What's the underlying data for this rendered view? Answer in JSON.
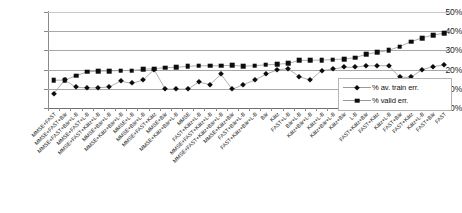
{
  "chart_data": {
    "type": "line",
    "title": "",
    "xlabel": "",
    "ylabel": "",
    "ylim": [
      0,
      50
    ],
    "yticks": [
      "0%",
      "10%",
      "20%",
      "30%",
      "40%",
      "50%"
    ],
    "grid": true,
    "legend_position": "inside-bottom-right",
    "categories": [
      "MMSE+FAST",
      "MMSE+FAST+Bär",
      "MMSE+FAST+Bär+L-B",
      "MMSE+FAST+L-B",
      "MMSE+FAST+Kätz+L-B",
      "MMSE+Bär+L-B",
      "MMSE+Kätz+Bär+L-B",
      "MMSE+L-B",
      "MMSE+Bär+L-B",
      "MMSE+FAST+Kätz",
      "MMSE+Bär",
      "MMSE+Kätz+Bär+L-B",
      "MMSE",
      "FAST+Kätz+L-B",
      "MMSE+FAST+Kätz+L-B",
      "MMSE+FAST+Kätz+Bär+L-B",
      "MMSE+Kätz+Bär",
      "FAST+Bär+L-B",
      "FAST+Kätz+Bär+L-B",
      "Bär",
      "Kätz",
      "FAST+L-B",
      "Bär+L-B",
      "Kätz+Bär+L-B",
      "Kätz+L-B",
      "Kätz+Bär+L-B",
      "Kätz+Bär",
      "L-B",
      "FAST+Kätz+Bär",
      "FAST+Kätz",
      "Kätz+L-B",
      "FAST+Bär",
      "FAST+Kätz",
      "Kätz+L-B",
      "FAST+Bär",
      "FAST"
    ],
    "series": [
      {
        "name": "% av. train err.",
        "marker": "diamond",
        "values": [
          7.5,
          14.5,
          10.8,
          10.5,
          10.5,
          11.0,
          14.0,
          12.8,
          14.5,
          20.0,
          9.8,
          9.8,
          9.8,
          13.5,
          12.2,
          17.5,
          9.7,
          12.2,
          14.5,
          17.5,
          19.8,
          20.5,
          16.3,
          14.5,
          19.5,
          20.2,
          21.2,
          21.2,
          22.0,
          22.0,
          22.0,
          16.0,
          16.0,
          20.0,
          21.5,
          22.5
        ]
      },
      {
        "name": "% valid err.",
        "marker": "square",
        "values": [
          14.5,
          14.5,
          16.8,
          18.8,
          19.2,
          19.3,
          19.5,
          19.5,
          20.2,
          20.5,
          21.0,
          21.2,
          21.7,
          22.0,
          22.0,
          22.0,
          22.2,
          21.8,
          22.0,
          22.5,
          22.8,
          23.2,
          24.8,
          24.8,
          25.0,
          25.2,
          25.5,
          26.2,
          28.0,
          29.0,
          30.0,
          32.0,
          34.5,
          36.5,
          38.0,
          39.0
        ]
      }
    ]
  },
  "legend": {
    "items": [
      {
        "label": "% av. train err.",
        "marker": "diamond"
      },
      {
        "label": "% valid err.",
        "marker": "square"
      }
    ]
  }
}
